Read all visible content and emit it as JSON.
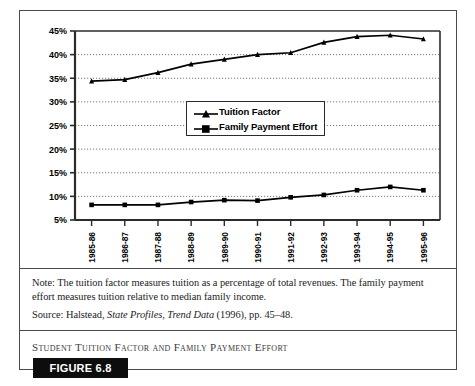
{
  "figure": {
    "tag_label": "FIGURE 6.8",
    "caption": "Student Tuition Factor and Family Payment Effort",
    "note_line1": "Note: The tuition factor measures tuition as a percentage of total revenues. The family payment",
    "note_line2": "effort measures tuition relative to median family income.",
    "source_prefix": "Source: Halstead, ",
    "source_italic1": "State Profiles, Trend Data",
    "source_suffix": " (1996), pp. 45–48."
  },
  "chart_data": {
    "type": "line",
    "title": "Student Tuition Factor and Family Payment Effort",
    "xlabel": "",
    "ylabel": "",
    "ylim": [
      5,
      45
    ],
    "ytick_labels": [
      "45%",
      "40%",
      "35%",
      "30%",
      "25%",
      "20%",
      "15%",
      "10%",
      "5%"
    ],
    "ytick_values": [
      45,
      40,
      35,
      30,
      25,
      20,
      15,
      10,
      5
    ],
    "grid": true,
    "grid_style": "dotted-horizontal",
    "legend_position": "inside-center",
    "categories": [
      "1985-86",
      "1986-87",
      "1987-88",
      "1988-89",
      "1989-90",
      "1990-91",
      "1991-92",
      "1992-93",
      "1993-94",
      "1994-95",
      "1995-96"
    ],
    "series": [
      {
        "name": "Tuition Factor",
        "marker": "triangle",
        "color": "#000000",
        "values": [
          34.4,
          34.7,
          36.2,
          38.0,
          39.0,
          40.0,
          40.4,
          42.6,
          43.8,
          44.1,
          43.3
        ]
      },
      {
        "name": "Family Payment Effort",
        "marker": "square",
        "color": "#000000",
        "values": [
          8.2,
          8.2,
          8.2,
          8.8,
          9.2,
          9.1,
          9.8,
          10.3,
          11.3,
          12.0,
          11.3
        ]
      }
    ]
  },
  "colors": {
    "frame": "#4a4a4a",
    "axis": "#2b2b2b",
    "grid": "#7a7a7a",
    "tag_bg": "#0d0d0d",
    "tag_fg": "#ffffff"
  }
}
